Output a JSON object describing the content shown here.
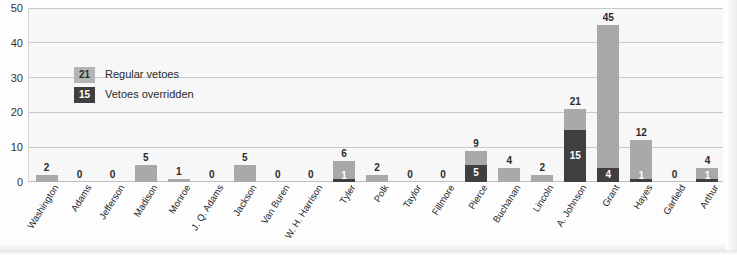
{
  "chart_data": {
    "type": "bar",
    "stacked": true,
    "title": "",
    "subtitle": "",
    "xlabel": "",
    "ylabel": "",
    "ylim": [
      0,
      50
    ],
    "yticks": [
      0,
      10,
      20,
      30,
      40,
      50
    ],
    "grid": true,
    "legend_position": "inside-upper-left",
    "legend": [
      {
        "sample_value": "21",
        "label": "Regular vetoes",
        "color": "#b4b4b4"
      },
      {
        "sample_value": "15",
        "label": "Vetoes overridden",
        "color": "#3f3f3f"
      }
    ],
    "categories": [
      "Washington",
      "Adams",
      "Jefferson",
      "Madison",
      "Monroe",
      "J. Q. Adams",
      "Jackson",
      "Van Buren",
      "W. H. Harrison",
      "Tyler",
      "Polk",
      "Taylor",
      "Fillmore",
      "Pierce",
      "Buchanan",
      "Lincoln",
      "A. Johnson",
      "Grant",
      "Hayes",
      "Garfield",
      "Arthur"
    ],
    "series": [
      {
        "name": "Regular vetoes",
        "color": "#a9a9a9",
        "values": [
          2,
          0,
          0,
          5,
          1,
          0,
          5,
          0,
          0,
          6,
          2,
          0,
          0,
          9,
          4,
          2,
          21,
          45,
          12,
          0,
          4
        ]
      },
      {
        "name": "Vetoes overridden",
        "color": "#3f3f3f",
        "values": [
          0,
          0,
          0,
          0,
          0,
          0,
          0,
          0,
          0,
          1,
          0,
          0,
          0,
          5,
          0,
          0,
          15,
          4,
          1,
          0,
          1
        ]
      }
    ],
    "bar_labels": {
      "totals": [
        "2",
        "0",
        "0",
        "5",
        "1",
        "0",
        "5",
        "0",
        "0",
        "6",
        "2",
        "0",
        "0",
        "9",
        "4",
        "2",
        "21",
        "45",
        "12",
        "0",
        "4"
      ],
      "overridden": [
        "",
        "",
        "",
        "",
        "",
        "",
        "",
        "",
        "",
        "1",
        "",
        "",
        "",
        "5",
        "",
        "",
        "15",
        "4",
        "1",
        "",
        "1"
      ]
    }
  }
}
